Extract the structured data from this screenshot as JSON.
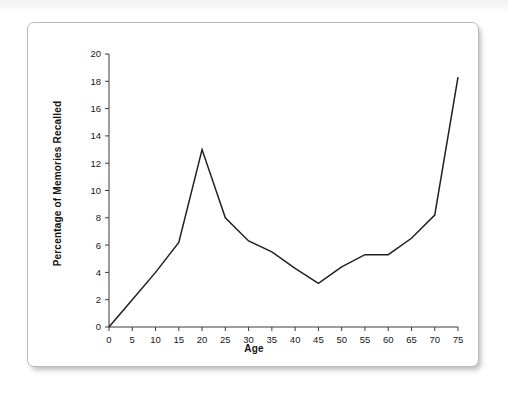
{
  "figure": {
    "background_color": "#ffffff",
    "sheet_border_color": "#b9b9b9",
    "line_color": "#231f20",
    "axis_color": "#3b3b3b"
  },
  "chart_data": {
    "type": "line",
    "title": "",
    "xlabel": "Age",
    "ylabel": "Percentage of Memories Recalled",
    "xlim": [
      0,
      75
    ],
    "ylim": [
      0,
      20
    ],
    "xticks": [
      0,
      5,
      10,
      15,
      20,
      25,
      30,
      35,
      40,
      45,
      50,
      55,
      60,
      65,
      70,
      75
    ],
    "yticks": [
      0,
      2,
      4,
      6,
      8,
      10,
      12,
      14,
      16,
      18,
      20
    ],
    "xtick_labels": [
      "0",
      "5",
      "10",
      "15",
      "20",
      "25",
      "30",
      "35",
      "40",
      "45",
      "50",
      "55",
      "60",
      "65",
      "70",
      "75"
    ],
    "ytick_labels": [
      "0",
      "2",
      "4",
      "6",
      "8",
      "10",
      "12",
      "14",
      "16",
      "18",
      "20"
    ],
    "grid": false,
    "legend": null,
    "x": [
      0,
      5,
      10,
      15,
      20,
      25,
      30,
      35,
      40,
      45,
      50,
      55,
      60,
      65,
      70,
      75
    ],
    "values": [
      0,
      2.0,
      4.0,
      6.2,
      13.0,
      8.0,
      6.3,
      5.5,
      4.3,
      3.2,
      4.4,
      5.3,
      5.3,
      6.5,
      8.2,
      18.3
    ],
    "series": [
      {
        "name": "Percentage of Memories Recalled",
        "values": [
          0,
          2.0,
          4.0,
          6.2,
          13.0,
          8.0,
          6.3,
          5.5,
          4.3,
          3.2,
          4.4,
          5.3,
          5.3,
          6.5,
          8.2,
          18.3
        ]
      }
    ],
    "annotations": []
  }
}
